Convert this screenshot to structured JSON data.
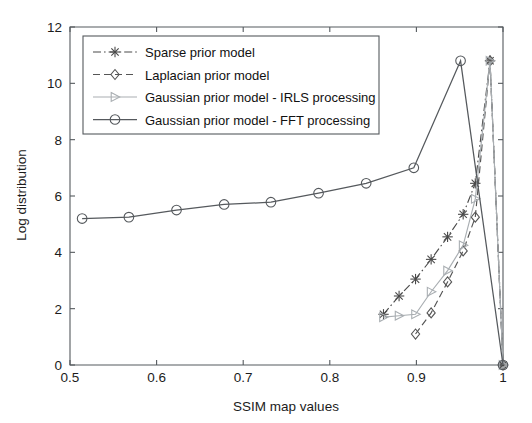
{
  "chart_data": {
    "type": "line",
    "title": "",
    "subtitle": "",
    "xlabel": "SSIM map values",
    "ylabel": "Log distribution",
    "xlim": [
      0.5,
      1.0
    ],
    "ylim": [
      0,
      12
    ],
    "xticks": [
      "0.5",
      "0.6",
      "0.7",
      "0.8",
      "0.9",
      "1"
    ],
    "xtick_values": [
      0.5,
      0.6,
      0.7,
      0.8,
      0.9,
      1.0
    ],
    "yticks": [
      "0",
      "2",
      "4",
      "6",
      "8",
      "10",
      "12"
    ],
    "ytick_values": [
      0,
      2,
      4,
      6,
      8,
      10,
      12
    ],
    "grid": false,
    "legend_position": "upper-left",
    "series": [
      {
        "name": "Sparse prior model",
        "marker": "asterisk",
        "linestyle": "dashdot",
        "color": "#4a4a4a",
        "x": [
          0.862,
          0.88,
          0.899,
          0.917,
          0.936,
          0.954,
          0.968,
          0.985,
          1.0
        ],
        "y": [
          1.8,
          2.45,
          3.05,
          3.75,
          4.55,
          5.35,
          6.45,
          10.8,
          0.0
        ]
      },
      {
        "name": "Laplacian prior model",
        "marker": "diamond",
        "linestyle": "dashed",
        "color": "#555555",
        "x": [
          0.899,
          0.917,
          0.936,
          0.954,
          0.968,
          0.985,
          1.0
        ],
        "y": [
          1.1,
          1.85,
          2.95,
          4.05,
          5.25,
          10.8,
          0.0
        ]
      },
      {
        "name": "Gaussian prior model - IRLS processing",
        "marker": "triangle-right",
        "linestyle": "solid",
        "color": "#a9aeb2",
        "x": [
          0.862,
          0.88,
          0.899,
          0.917,
          0.936,
          0.954,
          0.968,
          0.985,
          1.0
        ],
        "y": [
          1.7,
          1.75,
          1.8,
          2.6,
          3.35,
          4.25,
          5.9,
          10.8,
          0.0
        ]
      },
      {
        "name": "Gaussian prior model - FFT processing",
        "marker": "circle",
        "linestyle": "solid",
        "color": "#55595d",
        "x": [
          0.514,
          0.568,
          0.623,
          0.678,
          0.732,
          0.787,
          0.842,
          0.897,
          0.951,
          1.0
        ],
        "y": [
          5.2,
          5.25,
          5.5,
          5.7,
          5.78,
          6.1,
          6.45,
          7.0,
          10.8,
          0.0
        ]
      }
    ],
    "legend": [
      "Sparse prior model",
      "Laplacian prior model",
      "Gaussian prior model - IRLS processing",
      "Gaussian prior model - FFT processing"
    ]
  },
  "colors": {
    "axis": "#55595d",
    "text": "#1c1c1c",
    "background": "#ffffff",
    "sparse": "#4a4a4a",
    "laplacian": "#555555",
    "irls": "#a9aeb2",
    "fft": "#55595d"
  }
}
